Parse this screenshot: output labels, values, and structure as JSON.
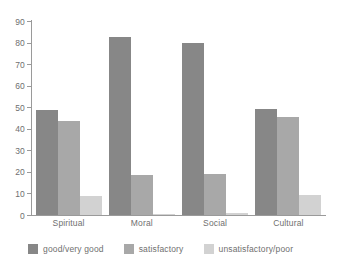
{
  "chart_data": {
    "type": "bar",
    "title": "",
    "subtitle": "",
    "xlabel": "",
    "ylabel": "",
    "ylim": [
      0,
      90
    ],
    "ytick_step": 10,
    "yticks": [
      90,
      80,
      70,
      60,
      50,
      40,
      30,
      20,
      10,
      0
    ],
    "ytick_labels": [
      "90",
      "80",
      "70",
      "60",
      "50",
      "40",
      "30",
      "20",
      "10",
      "0"
    ],
    "grid": false,
    "legend_position": "bottom",
    "categories": [
      "Spiritual",
      "Moral",
      "Social",
      "Cultural"
    ],
    "series": [
      {
        "name": "good/very good",
        "color": "#878787",
        "values": [
          48.5,
          82.5,
          80,
          49
        ]
      },
      {
        "name": "satisfactory",
        "color": "#a8a8a8",
        "values": [
          43.5,
          18.5,
          19,
          45.5
        ]
      },
      {
        "name": "unsatisfactory/poor",
        "color": "#d2d2d2",
        "values": [
          9,
          0.5,
          1,
          9.5
        ]
      }
    ],
    "axis_color": "#9a9a9a",
    "text_color": "#6f6f6f",
    "background": "#ffffff"
  }
}
